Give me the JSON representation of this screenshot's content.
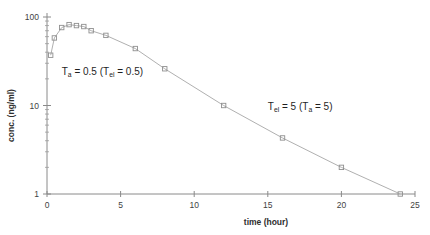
{
  "chart_data": {
    "type": "line",
    "title": "",
    "xlabel": "time (hour)",
    "ylabel": "conc. (ng/ml)",
    "yscale": "log",
    "xlim": [
      0,
      25
    ],
    "ylim": [
      1,
      100
    ],
    "xticks": [
      "0",
      "5",
      "10",
      "15",
      "20",
      "25"
    ],
    "xtick_values": [
      0,
      5,
      10,
      15,
      20,
      25
    ],
    "yticks": [
      "1",
      "10",
      "100"
    ],
    "ytick_values": [
      1,
      10,
      100
    ],
    "grid": false,
    "legend": "none",
    "marker": "open-square",
    "series": [
      {
        "name": "plasma concentration",
        "x": [
          0.25,
          0.5,
          1.0,
          1.5,
          2.0,
          2.5,
          3.0,
          4.0,
          6.0,
          8.0,
          12.0,
          16.0,
          20.0,
          24.0
        ],
        "y": [
          37,
          58,
          76,
          82,
          80,
          78,
          70,
          62,
          44,
          26,
          10,
          4.3,
          2.0,
          1.0
        ]
      }
    ],
    "annotations": [
      {
        "id": "absorption-phase-label",
        "text": "Ta = 0.5 (Tel = 0.5)",
        "parts": [
          {
            "t": "T"
          },
          {
            "t": "a",
            "sub": true
          },
          {
            "t": " = 0.5 ("
          },
          {
            "t": "T"
          },
          {
            "t": "el",
            "sub": true
          },
          {
            "t": " = 0.5)"
          }
        ],
        "x": 1.0,
        "y": 22
      },
      {
        "id": "elimination-phase-label",
        "text": "Tel = 5 (Ta = 5)",
        "parts": [
          {
            "t": "T"
          },
          {
            "t": "el",
            "sub": true
          },
          {
            "t": " = 5 ("
          },
          {
            "t": "T"
          },
          {
            "t": "a",
            "sub": true
          },
          {
            "t": " = 5)"
          }
        ],
        "x": 15.0,
        "y": 9.0
      }
    ],
    "colors": {
      "curve": "#b0b0b0",
      "marker": "#8f8f8f",
      "axis": "#8a8a8a",
      "text": "#2e2e2e",
      "background": "#ffffff"
    }
  }
}
